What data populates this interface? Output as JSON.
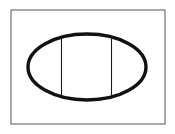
{
  "figure": {
    "name": "ellipse-with-two-vertical-chords",
    "canvas": {
      "width": 175,
      "height": 134,
      "background_color": "#ffffff"
    },
    "frame": {
      "name": "rectangle-border",
      "x": 11,
      "y": 10,
      "width": 154,
      "height": 114,
      "stroke_color": "#555555",
      "stroke_width": 1,
      "fill": "none"
    },
    "ellipse": {
      "name": "outer-ellipse",
      "center_x": 87,
      "center_y": 67,
      "radius_x": 59,
      "radius_y": 33,
      "stroke_color": "#111111",
      "stroke_width": 3.4,
      "fill": "none"
    },
    "chords": [
      {
        "name": "left-vertical-chord",
        "x": 61.5,
        "y_top": 38.5,
        "y_bottom": 95.5,
        "stroke_color": "#1a1a1a",
        "stroke_width": 1.1
      },
      {
        "name": "right-vertical-chord",
        "x": 111.5,
        "y_top": 38.5,
        "y_bottom": 95.5,
        "stroke_color": "#1a1a1a",
        "stroke_width": 1.1
      }
    ]
  }
}
